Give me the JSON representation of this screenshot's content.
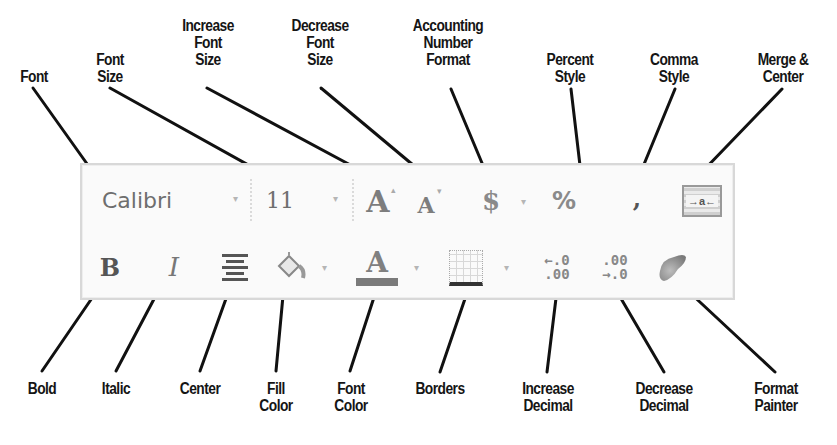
{
  "diagram": {
    "toolbar": {
      "font_name": "Calibri",
      "font_size": "11",
      "dropdown_glyph": "▾",
      "icons": {
        "increase_font": "A",
        "decrease_font": "A",
        "accounting": "$",
        "percent": "%",
        "comma": ",",
        "bold": "B",
        "italic": "I",
        "font_color": "A",
        "increase_decimal_top": "←.0",
        "increase_decimal_bottom": ".00",
        "decrease_decimal_top": ".00",
        "decrease_decimal_bottom": "→.0",
        "merge_center": "→a←"
      },
      "colors": {
        "border": "#d8d8d8",
        "background": "#fafafa",
        "icon_gray": "#7d7d7d",
        "font_color_bar": "#7a7a7a"
      }
    },
    "top_labels": [
      {
        "id": "font",
        "lines": [
          "Font"
        ]
      },
      {
        "id": "font-size",
        "lines": [
          "Font",
          "Size"
        ]
      },
      {
        "id": "increase-font-size",
        "lines": [
          "Increase",
          "Font",
          "Size"
        ]
      },
      {
        "id": "decrease-font-size",
        "lines": [
          "Decrease",
          "Font",
          "Size"
        ]
      },
      {
        "id": "accounting-number-format",
        "lines": [
          "Accounting",
          "Number",
          "Format"
        ]
      },
      {
        "id": "percent-style",
        "lines": [
          "Percent",
          "Style"
        ]
      },
      {
        "id": "comma-style",
        "lines": [
          "Comma",
          "Style"
        ]
      },
      {
        "id": "merge-center",
        "lines": [
          "Merge &",
          "Center"
        ]
      }
    ],
    "bottom_labels": [
      {
        "id": "bold",
        "lines": [
          "Bold"
        ]
      },
      {
        "id": "italic",
        "lines": [
          "Italic"
        ]
      },
      {
        "id": "center",
        "lines": [
          "Center"
        ]
      },
      {
        "id": "fill-color",
        "lines": [
          "Fill",
          "Color"
        ]
      },
      {
        "id": "font-color",
        "lines": [
          "Font",
          "Color"
        ]
      },
      {
        "id": "borders",
        "lines": [
          "Borders"
        ]
      },
      {
        "id": "increase-decimal",
        "lines": [
          "Increase",
          "Decimal"
        ]
      },
      {
        "id": "decrease-decimal",
        "lines": [
          "Decrease",
          "Decimal"
        ]
      },
      {
        "id": "format-painter",
        "lines": [
          "Format",
          "Painter"
        ]
      }
    ]
  }
}
